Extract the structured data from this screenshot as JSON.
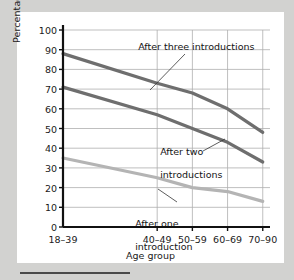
{
  "figure": {
    "background_color": "#d9d9d7",
    "page_background_color": "#d2d2d0",
    "plot_background_color": "#ffffff"
  },
  "chart_data": {
    "type": "line",
    "title": "",
    "xlabel": "Age group",
    "ylabel": "Percentage of names recalled",
    "categories": [
      "18–39",
      "40–49",
      "50–59",
      "60–69",
      "70–90"
    ],
    "ylim": [
      0,
      100
    ],
    "yticks": [
      0,
      10,
      20,
      30,
      40,
      50,
      60,
      70,
      80,
      90,
      100
    ],
    "ytick_labels": [
      "0",
      "10",
      "20",
      "30",
      "40",
      "50",
      "60",
      "70",
      "80",
      "90",
      "100"
    ],
    "grid": "horizontal-and-vertical",
    "legend": "inline-annotations",
    "series": [
      {
        "name": "After three introductions",
        "color": "#6e6e6e",
        "width": 3.2,
        "values": [
          88,
          73,
          68,
          60,
          48
        ]
      },
      {
        "name": "After two introductions",
        "color": "#6e6e6e",
        "width": 3.2,
        "values": [
          71,
          57,
          50,
          43,
          33
        ]
      },
      {
        "name": "After one introduction",
        "color": "#b4b4b4",
        "width": 3.2,
        "values": [
          35,
          25,
          20,
          18,
          13
        ]
      }
    ],
    "annotations": [
      {
        "text": "After three introductions",
        "line1": "After three introductions",
        "line2": ""
      },
      {
        "text": "After two introductions",
        "line1": "After two",
        "line2": "introductions"
      },
      {
        "text": "After one introduction",
        "line1": "After one",
        "line2": "introduction"
      }
    ]
  }
}
